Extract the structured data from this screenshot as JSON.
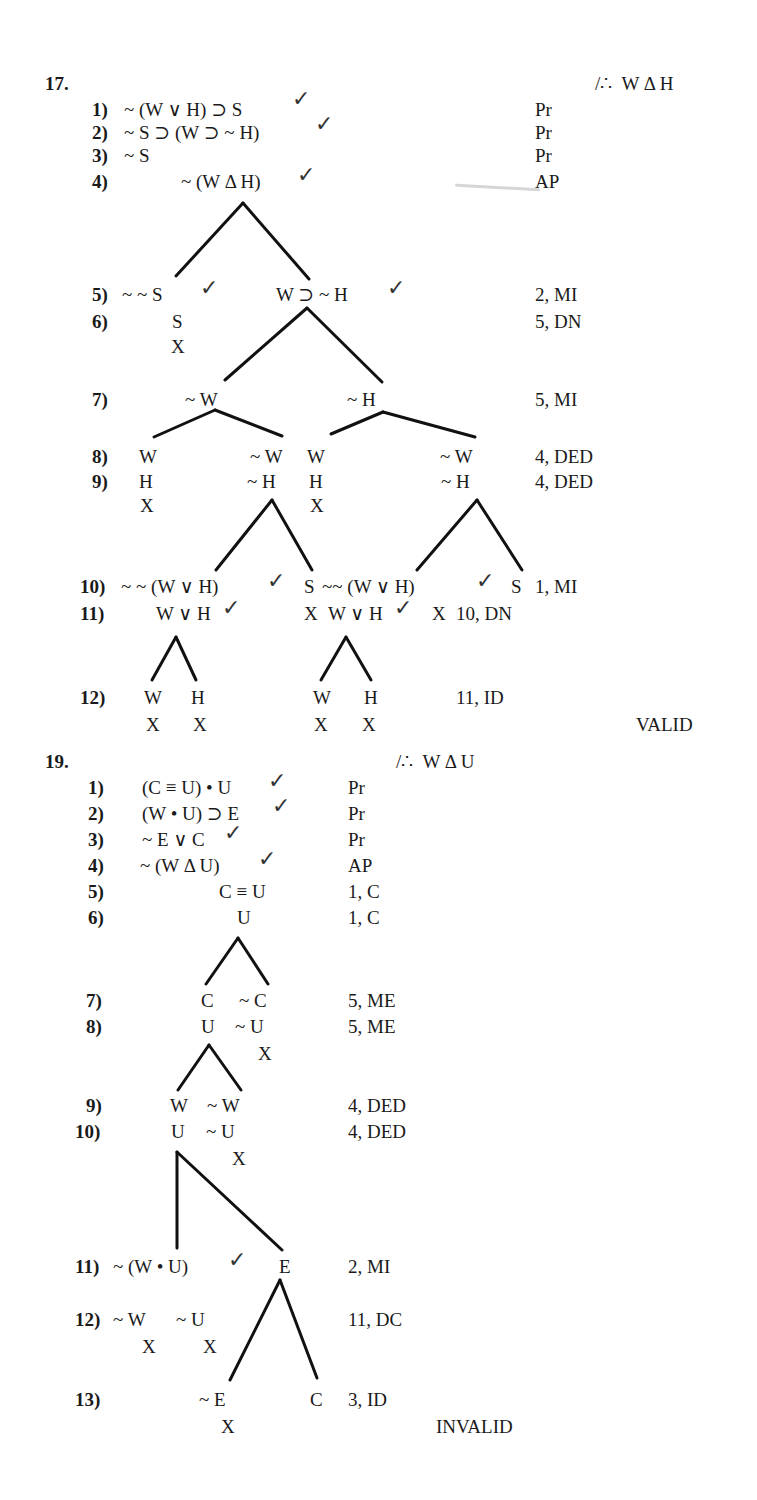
{
  "problem17": {
    "number": "17.",
    "conclusion": "/∴  W Δ H",
    "lines": [
      {
        "n": "1)",
        "formula": "~ (W ∨ H) ⊃ S",
        "just": "Pr"
      },
      {
        "n": "2)",
        "formula": "~ S ⊃ (W ⊃ ~ H)",
        "just": "Pr"
      },
      {
        "n": "3)",
        "formula": "~ S",
        "just": "Pr"
      },
      {
        "n": "4)",
        "formula": "~ (W Δ H)",
        "just": "AP"
      },
      {
        "n": "5)",
        "left": "~ ~ S",
        "right": "W ⊃ ~ H",
        "just": "2, MI"
      },
      {
        "n": "6)",
        "left": "S",
        "just": "5, DN"
      },
      {
        "n": "7)",
        "left": "~ W",
        "right": "~ H",
        "just": "5, MI"
      },
      {
        "n": "8)",
        "a": "W",
        "b": "~ W",
        "c": "W",
        "d": "~ W",
        "just": "4, DED"
      },
      {
        "n": "9)",
        "a": "H",
        "b": "~ H",
        "c": "H",
        "d": "~ H",
        "just": "4, DED"
      },
      {
        "n": "10)",
        "a": "~ ~ (W ∨ H)",
        "b": "S",
        "c": "~~ (W ∨ H)",
        "d": "S",
        "just": "1, MI"
      },
      {
        "n": "11)",
        "a": "W ∨ H",
        "b": "X",
        "c": "W ∨ H",
        "d": "X",
        "just": "10, DN"
      },
      {
        "n": "12)",
        "a": "W",
        "b": "H",
        "c": "W",
        "d": "H",
        "just": "11, ID"
      }
    ],
    "close_mark": "X",
    "check_mark": "✓",
    "verdict": "VALID"
  },
  "problem19": {
    "number": "19.",
    "conclusion": "/∴  W Δ U",
    "lines": [
      {
        "n": "1)",
        "formula": "(C ≡ U) • U",
        "just": "Pr"
      },
      {
        "n": "2)",
        "formula": "(W • U) ⊃ E",
        "just": "Pr"
      },
      {
        "n": "3)",
        "formula": "~ E ∨ C",
        "just": "Pr"
      },
      {
        "n": "4)",
        "formula": "~ (W Δ U)",
        "just": "AP"
      },
      {
        "n": "5)",
        "formula": "C ≡ U",
        "just": "1, C"
      },
      {
        "n": "6)",
        "formula": "U",
        "just": "1, C"
      },
      {
        "n": "7)",
        "left": "C",
        "right": "~ C",
        "just": "5, ME"
      },
      {
        "n": "8)",
        "left": "U",
        "right": "~ U",
        "just": "5, ME"
      },
      {
        "n": "9)",
        "left": "W",
        "right": "~ W",
        "just": "4, DED"
      },
      {
        "n": "10)",
        "left": "U",
        "right": "~ U",
        "just": "4, DED"
      },
      {
        "n": "11)",
        "left": "~ (W • U)",
        "right": "E",
        "just": "2, MI"
      },
      {
        "n": "12)",
        "left": "~ W",
        "right": "~ U",
        "just": "11, DC"
      },
      {
        "n": "13)",
        "left": "~ E",
        "right": "C",
        "just": "3, ID"
      }
    ],
    "close_mark": "X",
    "check_mark": "✓",
    "verdict": "INVALID"
  }
}
